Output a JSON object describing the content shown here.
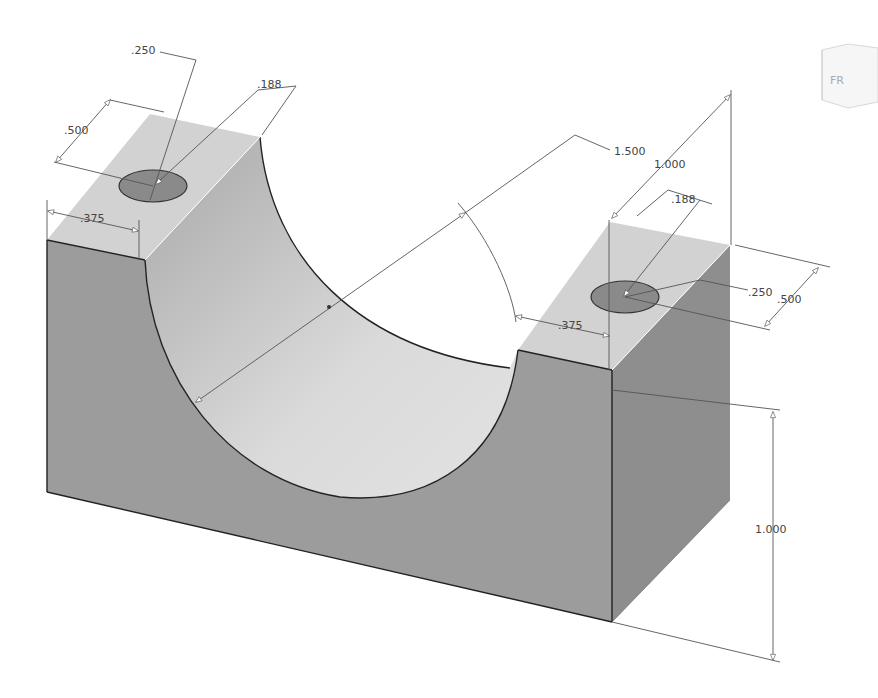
{
  "model": {
    "type": "isometric-part",
    "description": "Half-cylinder saddle block with two bolt holes",
    "colors": {
      "front_face": "#9a9a9a",
      "side_face": "#8c8c8c",
      "top_face": "#d4d4d4",
      "cut_face": "#d9d9d9",
      "hole": "#8a8a8a",
      "background": "#ffffff"
    }
  },
  "dimensions": {
    "left_hole_dia": ".250",
    "left_hole_to_edge": ".188",
    "left_width": ".500",
    "left_block_length": ".375",
    "bore_dia": "1.500",
    "total_depth": "1.000",
    "right_hole_to_edge": ".188",
    "right_hole_dia": ".250",
    "right_width": ".500",
    "right_block_length": ".375",
    "height": "1.000"
  },
  "viewcube": {
    "label": "FR"
  }
}
